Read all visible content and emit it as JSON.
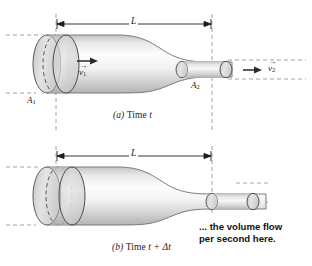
{
  "figure": {
    "background_color": "#ffffff",
    "ink_color": "#1d1d1d",
    "pipe_fill_light": "#fdfdfd",
    "pipe_fill_shadow": "#c9c9c9",
    "slug_fill": "#d3d3d3",
    "dashed_color": "#8a8a8a"
  },
  "panel_a": {
    "caption_prefix": "(a)",
    "caption_text": "Time",
    "caption_var": "t",
    "dimension_label": "L",
    "area_in_label": "A",
    "area_in_sub": "1",
    "area_out_label": "A",
    "area_out_sub": "2",
    "velocity_in_label": "v",
    "velocity_in_sub": "1",
    "velocity_in_arrow": "→",
    "velocity_out_label": "v",
    "velocity_out_sub": "2",
    "velocity_out_arrow": "→",
    "flow_arrow_in": "flow-arrow-right",
    "flow_arrow_out": "flow-arrow-right"
  },
  "panel_b": {
    "caption_prefix": "(b)",
    "caption_text": "Time",
    "caption_var": "t + Δt",
    "dimension_label": "L",
    "annotation_line1": "... the volume flow",
    "annotation_line2": "per second here."
  }
}
